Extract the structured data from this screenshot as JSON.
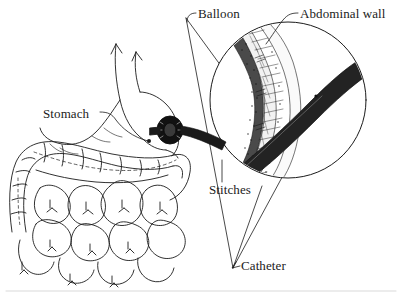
{
  "figure": {
    "background_color": "#ffffff",
    "ink_color": "#1b1b1b",
    "width": 402,
    "height": 298
  },
  "labels": {
    "balloon": "Balloon",
    "abdominal_wall": "Abdominal wall",
    "stomach": "Stomach",
    "stitches": "Stitches",
    "catheter": "Catheter"
  },
  "parts": {
    "stomach_outline": "stomach-organ",
    "esophagus": "esophagus-tube",
    "colon": "large-intestine-loops",
    "small_bowel": "small-intestine-coils",
    "retention_disc": "external-bolster-disc",
    "catheter_tube": "catheter-tube",
    "inset_circle": "magnified-inset-circle",
    "wall_layers": "abdominal-wall-layers",
    "leader_lines": "label-leader-lines",
    "magnifier_cone": "magnification-cone-lines",
    "frame_rule": "bottom-border-rule"
  }
}
